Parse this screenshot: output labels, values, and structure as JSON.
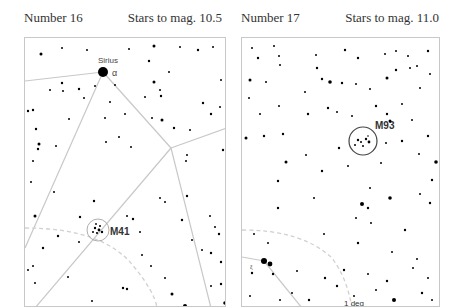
{
  "charts": [
    {
      "number_label": "Number 16",
      "magnitude_label": "Stars to mag. 10.5",
      "bright_star": {
        "name": "Sirius",
        "greek": "α"
      },
      "object": {
        "name": "M41",
        "type": "open-cluster"
      },
      "line_color": "#c4c4c4",
      "arc_color": "#d0d0d0"
    },
    {
      "number_label": "Number 17",
      "magnitude_label": "Stars to mag. 11.0",
      "object": {
        "name": "M93",
        "type": "open-cluster"
      },
      "double_star_label": "ξ",
      "scale_label": "1 deg",
      "line_color": "#c4c4c4",
      "arc_color": "#d0d0d0"
    }
  ]
}
